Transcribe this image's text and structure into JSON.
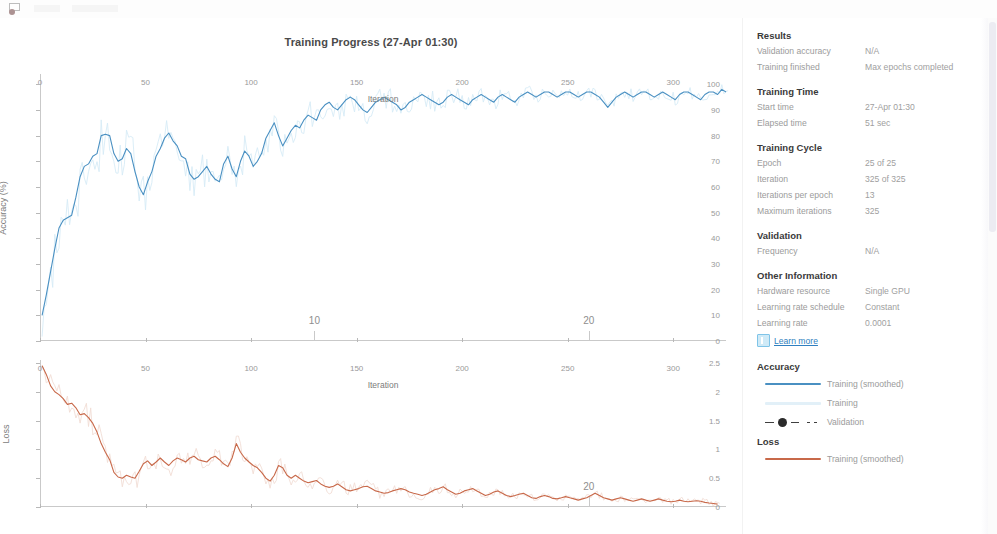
{
  "window": {
    "title": "Training Progress (27-Apr 01:30)"
  },
  "toolbar": {
    "icon": "export-image-icon"
  },
  "panel": {
    "results": {
      "heading": "Results",
      "rows": [
        {
          "key": "Validation accuracy",
          "value": "N/A"
        },
        {
          "key": "Training finished",
          "value": "Max epochs completed"
        }
      ]
    },
    "training_time": {
      "heading": "Training Time",
      "rows": [
        {
          "key": "Start time",
          "value": "27-Apr 01:30"
        },
        {
          "key": "Elapsed time",
          "value": "51 sec"
        }
      ]
    },
    "training_cycle": {
      "heading": "Training Cycle",
      "rows": [
        {
          "key": "Epoch",
          "value": "25 of 25"
        },
        {
          "key": "Iteration",
          "value": "325 of 325"
        },
        {
          "key": "Iterations per epoch",
          "value": "13"
        },
        {
          "key": "Maximum iterations",
          "value": "325"
        }
      ]
    },
    "validation": {
      "heading": "Validation",
      "rows": [
        {
          "key": "Frequency",
          "value": "N/A"
        }
      ]
    },
    "other_information": {
      "heading": "Other Information",
      "rows": [
        {
          "key": "Hardware resource",
          "value": "Single GPU"
        },
        {
          "key": "Learning rate schedule",
          "value": "Constant"
        },
        {
          "key": "Learning rate",
          "value": "0.0001"
        }
      ]
    },
    "learn_more": {
      "label": "Learn more",
      "icon": "info-doc-icon"
    },
    "legend": {
      "accuracy": {
        "heading": "Accuracy",
        "items": [
          {
            "label": "Training (smoothed)",
            "style": "solid",
            "color": "#4a90c2"
          },
          {
            "label": "Training",
            "style": "solid-pale",
            "color": "#9ecde8"
          },
          {
            "label": "Validation",
            "style": "dashed-marker",
            "color": "#2b2b2b"
          }
        ]
      },
      "loss": {
        "heading": "Loss",
        "items": [
          {
            "label": "Training (smoothed)",
            "style": "solid",
            "color": "#c8694a"
          }
        ]
      }
    }
  },
  "colors": {
    "accuracy_line": "#4a90c2",
    "accuracy_raw": "#b7dcf0",
    "loss_line": "#c8694a",
    "loss_raw": "#e8c3b4",
    "axis": "#c9c9c9",
    "tick_text": "#9a9a9a",
    "link": "#2f7fc0"
  },
  "chart_data": [
    {
      "type": "line",
      "id": "accuracy",
      "title": "Training Progress (27-Apr 01:30)",
      "xlabel": "Iteration",
      "ylabel": "Accuracy (%)",
      "xlim": [
        0,
        325
      ],
      "ylim": [
        0,
        104
      ],
      "xticks": [
        0,
        50,
        100,
        150,
        200,
        250,
        300
      ],
      "yticks": [
        0,
        10,
        20,
        30,
        40,
        50,
        60,
        70,
        80,
        90,
        100
      ],
      "grid": false,
      "legend_position": "right-panel",
      "epoch_markers": [
        {
          "label": "10",
          "iteration": 130
        },
        {
          "label": "20",
          "iteration": 260
        }
      ],
      "series": [
        {
          "name": "Training (smoothed)",
          "color": "#4a90c2",
          "x": [
            1,
            3,
            5,
            7,
            9,
            11,
            13,
            15,
            17,
            19,
            21,
            23,
            25,
            27,
            29,
            31,
            33,
            35,
            37,
            39,
            41,
            43,
            45,
            47,
            49,
            51,
            53,
            55,
            57,
            59,
            61,
            63,
            65,
            67,
            69,
            71,
            73,
            75,
            77,
            79,
            81,
            83,
            85,
            87,
            89,
            91,
            93,
            95,
            97,
            99,
            101,
            103,
            105,
            107,
            109,
            111,
            113,
            115,
            117,
            119,
            121,
            123,
            125,
            127,
            129,
            131,
            133,
            135,
            137,
            139,
            141,
            143,
            145,
            147,
            149,
            151,
            153,
            155,
            157,
            159,
            161,
            163,
            165,
            167,
            169,
            171,
            173,
            175,
            177,
            179,
            181,
            183,
            185,
            187,
            189,
            191,
            193,
            195,
            197,
            199,
            201,
            203,
            205,
            207,
            209,
            211,
            213,
            215,
            217,
            219,
            221,
            223,
            225,
            227,
            229,
            231,
            233,
            235,
            237,
            239,
            241,
            243,
            245,
            247,
            249,
            251,
            253,
            255,
            257,
            259,
            261,
            263,
            265,
            267,
            269,
            271,
            273,
            275,
            277,
            279,
            281,
            283,
            285,
            287,
            289,
            291,
            293,
            295,
            297,
            299,
            301,
            303,
            305,
            307,
            309,
            311,
            313,
            315,
            317,
            319,
            321,
            323,
            325
          ],
          "y": [
            10,
            18,
            27,
            36,
            44,
            47,
            48,
            49,
            56,
            64,
            68,
            69,
            72,
            73,
            80,
            80.5,
            80,
            73,
            70,
            71,
            75,
            73,
            66,
            60,
            57,
            62,
            66,
            72,
            75,
            79,
            81,
            78,
            76,
            72,
            71,
            65,
            63,
            64,
            66,
            68,
            65,
            63,
            62,
            69,
            72,
            67,
            64,
            70,
            74,
            72,
            68,
            70,
            73,
            79,
            82,
            85,
            80,
            76,
            79,
            82,
            84,
            83,
            86,
            88,
            87,
            86,
            90,
            92,
            93,
            91,
            90,
            92,
            94,
            95,
            94,
            92,
            90,
            89,
            91,
            93,
            94,
            95,
            94,
            93,
            92,
            90,
            91,
            93,
            94,
            95,
            96,
            95,
            94,
            93,
            92,
            93,
            95,
            96,
            95,
            94,
            93,
            92,
            94,
            95,
            96,
            95,
            94,
            93,
            95,
            96,
            95,
            94,
            93,
            95,
            96,
            97,
            96,
            95,
            96,
            97,
            97,
            96,
            95,
            96,
            97,
            97,
            96,
            95,
            96,
            97,
            97,
            96,
            95,
            93,
            91,
            93,
            95,
            96,
            97,
            96,
            95,
            96,
            97,
            97,
            96,
            95,
            96,
            97,
            96,
            95,
            94,
            96,
            97,
            97,
            96,
            95,
            94,
            96,
            97,
            97,
            96,
            98,
            97,
            99
          ]
        },
        {
          "name": "Training",
          "color": "#b7dcf0",
          "note": "raw noisy trace underlying the smoothed curve, same range"
        },
        {
          "name": "Validation",
          "color": "#2b2b2b",
          "x": [],
          "y": [],
          "note": "no validation data (N/A)"
        }
      ]
    },
    {
      "type": "line",
      "id": "loss",
      "xlabel": "Iteration",
      "ylabel": "Loss",
      "xlim": [
        0,
        325
      ],
      "ylim": [
        0,
        2.55
      ],
      "xticks": [
        0,
        50,
        100,
        150,
        200,
        250,
        300
      ],
      "yticks": [
        0,
        0.5,
        1,
        1.5,
        2,
        2.5
      ],
      "grid": false,
      "epoch_markers": [
        {
          "label": "20",
          "iteration": 260
        }
      ],
      "series": [
        {
          "name": "Training (smoothed)",
          "color": "#c8694a",
          "x": [
            1,
            3,
            5,
            7,
            9,
            11,
            13,
            15,
            17,
            19,
            21,
            23,
            25,
            27,
            29,
            31,
            33,
            35,
            37,
            39,
            41,
            43,
            45,
            47,
            49,
            51,
            53,
            55,
            57,
            59,
            61,
            63,
            65,
            67,
            69,
            71,
            73,
            75,
            77,
            79,
            81,
            83,
            85,
            87,
            89,
            91,
            93,
            95,
            97,
            99,
            101,
            103,
            105,
            107,
            109,
            111,
            113,
            115,
            117,
            119,
            121,
            123,
            125,
            127,
            129,
            131,
            133,
            135,
            137,
            139,
            141,
            143,
            145,
            147,
            149,
            151,
            153,
            155,
            157,
            159,
            161,
            163,
            165,
            167,
            169,
            171,
            173,
            175,
            177,
            179,
            181,
            183,
            185,
            187,
            189,
            191,
            193,
            195,
            197,
            199,
            201,
            203,
            205,
            207,
            209,
            211,
            213,
            215,
            217,
            219,
            221,
            223,
            225,
            227,
            229,
            231,
            233,
            235,
            237,
            239,
            241,
            243,
            245,
            247,
            249,
            251,
            253,
            255,
            257,
            259,
            261,
            263,
            265,
            267,
            269,
            271,
            273,
            275,
            277,
            279,
            281,
            283,
            285,
            287,
            289,
            291,
            293,
            295,
            297,
            299,
            301,
            303,
            305,
            307,
            309,
            311,
            313,
            315,
            317,
            319,
            321,
            323,
            325
          ],
          "y": [
            2.45,
            2.3,
            2.1,
            2.0,
            1.95,
            1.88,
            1.78,
            1.8,
            1.72,
            1.6,
            1.62,
            1.55,
            1.45,
            1.3,
            1.1,
            0.95,
            0.82,
            0.6,
            0.52,
            0.5,
            0.55,
            0.52,
            0.5,
            0.62,
            0.75,
            0.8,
            0.72,
            0.78,
            0.85,
            0.78,
            0.72,
            0.8,
            0.85,
            0.82,
            0.78,
            0.85,
            0.88,
            0.82,
            0.8,
            0.78,
            0.85,
            0.88,
            0.82,
            0.75,
            0.7,
            0.85,
            1.1,
            0.95,
            0.85,
            0.78,
            0.72,
            0.68,
            0.6,
            0.5,
            0.45,
            0.55,
            0.72,
            0.68,
            0.55,
            0.5,
            0.55,
            0.5,
            0.45,
            0.42,
            0.44,
            0.46,
            0.4,
            0.36,
            0.34,
            0.36,
            0.4,
            0.35,
            0.3,
            0.28,
            0.3,
            0.32,
            0.35,
            0.36,
            0.32,
            0.28,
            0.26,
            0.24,
            0.25,
            0.28,
            0.3,
            0.32,
            0.3,
            0.26,
            0.24,
            0.22,
            0.2,
            0.22,
            0.26,
            0.3,
            0.32,
            0.35,
            0.3,
            0.26,
            0.22,
            0.24,
            0.28,
            0.3,
            0.32,
            0.28,
            0.24,
            0.2,
            0.22,
            0.26,
            0.28,
            0.24,
            0.2,
            0.18,
            0.2,
            0.22,
            0.24,
            0.2,
            0.16,
            0.15,
            0.18,
            0.2,
            0.18,
            0.15,
            0.14,
            0.16,
            0.18,
            0.16,
            0.14,
            0.12,
            0.14,
            0.16,
            0.2,
            0.24,
            0.2,
            0.16,
            0.14,
            0.12,
            0.14,
            0.16,
            0.14,
            0.12,
            0.1,
            0.12,
            0.14,
            0.12,
            0.1,
            0.12,
            0.14,
            0.12,
            0.1,
            0.09,
            0.1,
            0.12,
            0.1,
            0.09,
            0.1,
            0.11,
            0.1,
            0.08,
            0.07,
            0.06,
            0.05
          ]
        },
        {
          "name": "Training",
          "color": "#e8c3b4",
          "note": "raw noisy trace underlying the smoothed curve"
        }
      ]
    }
  ]
}
